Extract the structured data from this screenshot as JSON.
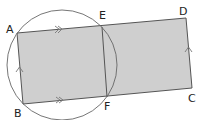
{
  "diagram": {
    "type": "geometry",
    "colors": {
      "fill": "#cfcfcf",
      "stroke": "#555555",
      "circle": "#666666",
      "text": "#222222"
    },
    "points": {
      "A": {
        "label": "A",
        "x": 17,
        "y": 33
      },
      "B": {
        "label": "B",
        "x": 23,
        "y": 104
      },
      "C": {
        "label": "C",
        "x": 192,
        "y": 88
      },
      "D": {
        "label": "D",
        "x": 186,
        "y": 18
      },
      "E": {
        "label": "E",
        "x": 102,
        "y": 27
      },
      "F": {
        "label": "F",
        "x": 107,
        "y": 97
      }
    },
    "circle": {
      "cx": 62,
      "cy": 65,
      "r": 55
    },
    "shapes": [
      "parallelogram ABCD (shaded)",
      "segment EF",
      "circle through A, B, E, F"
    ],
    "markings": [
      {
        "segment": "AE",
        "type": "double-arrow"
      },
      {
        "segment": "BF",
        "type": "double-arrow"
      },
      {
        "segment": "BA",
        "type": "single-arrow"
      },
      {
        "segment": "CD",
        "type": "single-arrow"
      }
    ]
  }
}
